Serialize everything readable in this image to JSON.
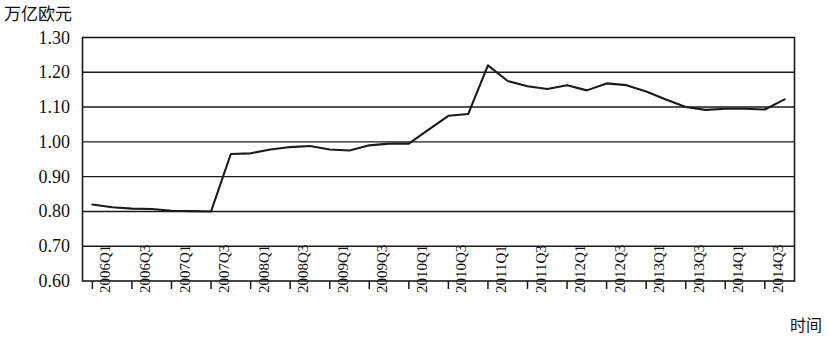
{
  "chart_data": {
    "type": "line",
    "title": "",
    "ylabel": "万亿欧元",
    "xlabel": "时间",
    "ylim": [
      0.6,
      1.3
    ],
    "ytick_labels": [
      "1.30",
      "1.20",
      "1.10",
      "1.00",
      "0.90",
      "0.80",
      "0.70",
      "0.60"
    ],
    "ytick_values": [
      1.3,
      1.2,
      1.1,
      1.0,
      0.9,
      0.8,
      0.7,
      0.6
    ],
    "grid": "horizontal",
    "legend": "none",
    "xtick_labels": [
      "2006Q1",
      "2006Q3",
      "2007Q1",
      "2007Q3",
      "2008Q1",
      "2008Q3",
      "2009Q1",
      "2009Q3",
      "2010Q1",
      "2010Q3",
      "2011Q1",
      "2011Q3",
      "2012Q1",
      "2012Q3",
      "2013Q1",
      "2013Q3",
      "2014Q1",
      "2014Q3"
    ],
    "categories": [
      "2006Q1",
      "2006Q2",
      "2006Q3",
      "2006Q4",
      "2007Q1",
      "2007Q2",
      "2007Q3",
      "2007Q4",
      "2008Q1",
      "2008Q2",
      "2008Q3",
      "2008Q4",
      "2009Q1",
      "2009Q2",
      "2009Q3",
      "2009Q4",
      "2010Q1",
      "2010Q2",
      "2010Q3",
      "2010Q4",
      "2011Q1",
      "2011Q2",
      "2011Q3",
      "2011Q4",
      "2012Q1",
      "2012Q2",
      "2012Q3",
      "2012Q4",
      "2013Q1",
      "2013Q2",
      "2013Q3",
      "2013Q4",
      "2014Q1",
      "2014Q2",
      "2014Q3",
      "2014Q4"
    ],
    "values": [
      0.82,
      0.812,
      0.808,
      0.807,
      0.802,
      0.801,
      0.8,
      0.965,
      0.967,
      0.978,
      0.985,
      0.988,
      0.978,
      0.975,
      0.99,
      0.995,
      0.995,
      1.035,
      1.075,
      1.08,
      1.22,
      1.175,
      1.16,
      1.152,
      1.163,
      1.148,
      1.168,
      1.163,
      1.145,
      1.122,
      1.1,
      1.092,
      1.095,
      1.095,
      1.093,
      1.122
    ],
    "series_color": "#1a1a1a",
    "axis_color": "#1a1a1a"
  }
}
